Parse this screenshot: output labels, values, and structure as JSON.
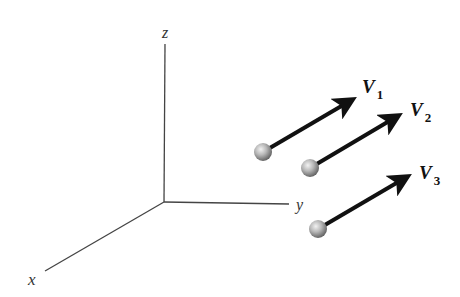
{
  "diagram": {
    "type": "3d-coordinate-axes-with-vectors",
    "axes": {
      "x": {
        "label": "x"
      },
      "y": {
        "label": "y"
      },
      "z": {
        "label": "z"
      }
    },
    "vectors": [
      {
        "name": "V",
        "subscript": "1",
        "description": "sphere with arrow pointing up-right"
      },
      {
        "name": "V",
        "subscript": "2",
        "description": "sphere with arrow pointing up-right"
      },
      {
        "name": "V",
        "subscript": "3",
        "description": "sphere with arrow pointing up-right"
      }
    ],
    "colors": {
      "axis": "#444444",
      "arrow": "#111111",
      "sphere_light": "#e8e8e8",
      "sphere_dark": "#6a6a6a"
    }
  }
}
